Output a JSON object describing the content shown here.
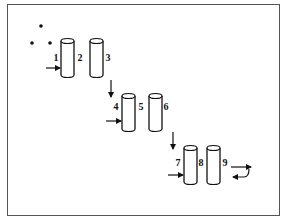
{
  "diagram": {
    "type": "sequential multi-column process schematic",
    "border_color": "#555555",
    "stroke_color": "#111111",
    "dots": [
      {
        "x": 41,
        "y": 26
      },
      {
        "x": 32,
        "y": 43
      },
      {
        "x": 50,
        "y": 43
      }
    ],
    "stages": [
      {
        "columns": [
          {
            "id": 1,
            "x": 61,
            "label": "1",
            "label_x": 56
          },
          {
            "id": 2,
            "x": 90,
            "label": "2",
            "label_x": 80,
            "side_label": "3",
            "side_label_x": 108
          }
        ],
        "top": 41,
        "bottom": 75,
        "label_y": 61,
        "inlet_arrow": {
          "x1": 46,
          "x2": 60,
          "y": 68
        }
      },
      {
        "columns": [
          {
            "id": 4,
            "x": 122,
            "label": "4",
            "label_x": 116
          },
          {
            "id": 5,
            "x": 149,
            "label": "5",
            "label_x": 141,
            "side_label": "6",
            "side_label_x": 166
          }
        ],
        "top": 96,
        "bottom": 129,
        "label_y": 110,
        "inlet_arrow": {
          "x1": 106,
          "x2": 121,
          "y": 121
        }
      },
      {
        "columns": [
          {
            "id": 7,
            "x": 184,
            "label": "7",
            "label_x": 178
          },
          {
            "id": 8,
            "x": 207,
            "label": "8",
            "label_x": 201,
            "side_label": "9",
            "side_label_x": 225
          }
        ],
        "top": 148,
        "bottom": 182,
        "label_y": 166,
        "inlet_arrow": {
          "x1": 168,
          "x2": 183,
          "y": 175
        }
      }
    ],
    "down_arrows": [
      {
        "x": 111,
        "y1": 80,
        "y2": 97
      },
      {
        "x": 173,
        "y1": 132,
        "y2": 149
      }
    ],
    "recycle_arrows": {
      "forward": {
        "x1": 231,
        "x2": 251,
        "y": 167
      },
      "return": {
        "x_start": 249,
        "y_start": 168,
        "x_end": 233,
        "y_end": 177
      }
    }
  }
}
